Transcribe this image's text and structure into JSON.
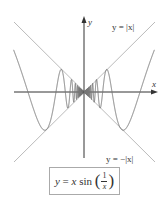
{
  "figure": {
    "axis_labels": {
      "x": "x",
      "y": "y"
    },
    "upper_envelope_label": "y = |x|",
    "lower_envelope_label": "y = −|x|",
    "formula": {
      "lhs": "y",
      "eq": " = ",
      "x": "x",
      "fn": " sin ",
      "open": "(",
      "num": "1",
      "den": "x",
      "close": ")"
    },
    "colors": {
      "axes": "#333333",
      "curve": "#777777",
      "envelope": "#bbbbbb",
      "box_border": "#aaaaaa"
    }
  },
  "chart_data": {
    "type": "line",
    "xlabel": "x",
    "ylabel": "y",
    "series": [
      {
        "name": "y = x sin(1/x)",
        "function": "x*sin(1/x)",
        "domain": [
          -0.4,
          0.4
        ]
      },
      {
        "name": "y = |x|",
        "function": "abs(x)",
        "domain": [
          -0.4,
          0.4
        ]
      },
      {
        "name": "y = -|x|",
        "function": "-abs(x)",
        "domain": [
          -0.4,
          0.4
        ]
      }
    ],
    "xlim": [
      -0.4,
      0.4
    ],
    "ylim": [
      -0.4,
      0.4
    ],
    "grid": false,
    "legend": "inline labels"
  }
}
